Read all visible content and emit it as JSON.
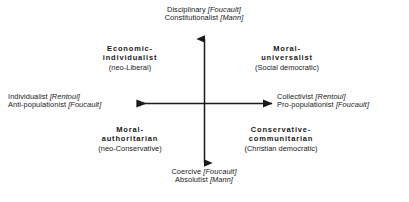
{
  "figure": {
    "type": "two-axis-quadrant-diagram",
    "background_color": "#fefefe",
    "ink_color": "#1a1a1a",
    "width": 409,
    "height": 202
  },
  "axes": {
    "vertical": {
      "orientation": "vertical",
      "arrowheads": "both",
      "top_label_lines": [
        {
          "term": "Disciplinary",
          "cite": "[Foucault]"
        },
        {
          "term": "Constitutionalist",
          "cite": "[Mann]"
        }
      ],
      "bottom_label_lines": [
        {
          "term": "Coercive",
          "cite": "[Foucault]"
        },
        {
          "term": "Absolutist",
          "cite": "[Mann]"
        }
      ]
    },
    "horizontal": {
      "orientation": "horizontal",
      "arrowheads": "both",
      "left_label_lines": [
        {
          "term": "Individualist",
          "cite": "[Rentoul]"
        },
        {
          "term": "Anti-populationist",
          "cite": "[Foucault]"
        }
      ],
      "right_label_lines": [
        {
          "term": "Collectivist",
          "cite": "[Rentoul]"
        },
        {
          "term": "Pro-populationist",
          "cite": "[Foucault]"
        }
      ]
    }
  },
  "poles": {
    "top": {
      "line1_term": "Disciplinary",
      "line1_cite": "[Foucault]",
      "line2_term": "Constitutionalist",
      "line2_cite": "[Mann]"
    },
    "bottom": {
      "line1_term": "Coercive",
      "line1_cite": "[Foucault]",
      "line2_term": "Absolutist",
      "line2_cite": "[Mann]"
    },
    "left": {
      "line1_term": "Individualist",
      "line1_cite": "[Rentoul]",
      "line2_term": "Anti-populationist",
      "line2_cite": "[Foucault]"
    },
    "right": {
      "line1_term": "Collectivist",
      "line1_cite": "[Rentoul]",
      "line2_term": "Pro-populationist",
      "line2_cite": "[Foucault]"
    }
  },
  "quadrants": {
    "top_left": {
      "head_line1": "Economic-",
      "head_line2": "individualist",
      "subtitle": "(neo-Liberal)"
    },
    "top_right": {
      "head_line1": "Moral-",
      "head_line2": "universalist",
      "subtitle": "(Social democratic)"
    },
    "bottom_left": {
      "head_line1": "Moral-",
      "head_line2": "authoritarian",
      "subtitle": "(neo-Conservative)"
    },
    "bottom_right": {
      "head_line1": "Conservative-",
      "head_line2": "communitarian",
      "subtitle": "(Christian democratic)"
    }
  }
}
